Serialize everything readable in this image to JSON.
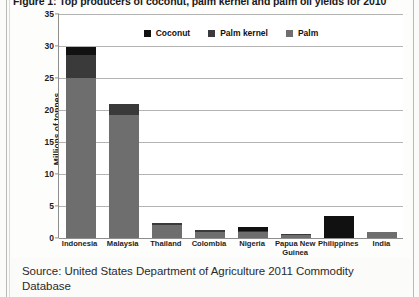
{
  "figure": {
    "title": "Figure 1: Top producers of coconut, palm kernel and palm oil yields for 2010"
  },
  "legend": {
    "position": "top-center",
    "items": [
      {
        "label": "Coconut",
        "color": "#111111"
      },
      {
        "label": "Palm kernel",
        "color": "#3a3a3a"
      },
      {
        "label": "Palm",
        "color": "#6e6e6e"
      }
    ]
  },
  "source": {
    "text": "Source: United States Department of Agriculture 2011 Commodity Database"
  },
  "chart_data": {
    "type": "bar",
    "subtype": "stacked-vertical",
    "title": "Figure 1: Top producers of coconut, palm kernel and palm oil yields for 2010",
    "xlabel": "",
    "ylabel": "Millions of tonnes",
    "ylim": [
      0,
      35
    ],
    "yticks": [
      0,
      5,
      10,
      15,
      20,
      25,
      30,
      35
    ],
    "grid": true,
    "legend": [
      "Coconut",
      "Palm kernel",
      "Palm"
    ],
    "categories": [
      "Indonesia",
      "Malaysia",
      "Thailand",
      "Colombia",
      "Nigeria",
      "Papua New Guinea",
      "Philippines",
      "India"
    ],
    "series": [
      {
        "name": "Palm",
        "color": "#6e6e6e",
        "values": [
          25.0,
          19.2,
          2.0,
          1.0,
          0.9,
          0.5,
          0.0,
          0.9
        ]
      },
      {
        "name": "Palm kernel",
        "color": "#3a3a3a",
        "values": [
          3.6,
          1.8,
          0.4,
          0.3,
          0.2,
          0.1,
          0.0,
          0.1
        ]
      },
      {
        "name": "Coconut",
        "color": "#111111",
        "values": [
          1.2,
          0.0,
          0.0,
          0.0,
          0.7,
          0.0,
          3.5,
          0.0
        ]
      }
    ],
    "totals": [
      29.8,
      21.0,
      2.4,
      1.3,
      1.8,
      0.6,
      3.5,
      1.0
    ]
  }
}
